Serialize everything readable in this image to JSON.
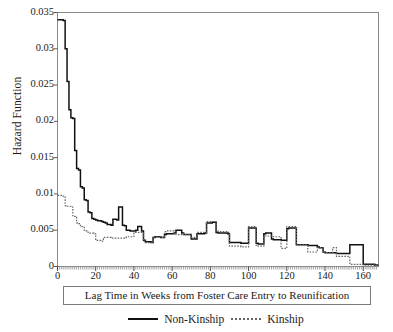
{
  "axes": {
    "ylabel": "Hazard Function",
    "xlabel_box": "Lag Time in Weeks from Foster Care Entry to Reunification",
    "yticks": [
      "0",
      "0.005",
      "0.01",
      "0.015",
      "0.02",
      "0.025",
      "0.03",
      "0.035"
    ],
    "xticks": [
      "0",
      "20",
      "40",
      "60",
      "80",
      "100",
      "120",
      "140",
      "160"
    ]
  },
  "legend": {
    "items": [
      {
        "label": "Non-Kinship",
        "style": "solid",
        "color": "#111111"
      },
      {
        "label": "Kinship",
        "style": "dashed",
        "color": "#666666"
      }
    ]
  },
  "chart_data": {
    "type": "line",
    "title": "",
    "xlabel": "Lag Time in Weeks from Foster Care Entry to Reunification",
    "ylabel": "Hazard Function",
    "xlim": [
      0,
      168
    ],
    "ylim": [
      0,
      0.035
    ],
    "xticks": [
      0,
      20,
      40,
      60,
      80,
      100,
      120,
      140,
      160
    ],
    "yticks": [
      0,
      0.005,
      0.01,
      0.015,
      0.02,
      0.025,
      0.03,
      0.035
    ],
    "grid": false,
    "legend_position": "below-axes",
    "step": "post",
    "series": [
      {
        "name": "Non-Kinship",
        "style": "solid",
        "color": "#111111",
        "x": [
          0,
          1,
          2,
          3,
          4,
          5,
          6,
          7,
          8,
          9,
          10,
          11,
          12,
          13,
          14,
          15,
          16,
          17,
          18,
          19,
          20,
          21,
          22,
          23,
          24,
          25,
          26,
          27,
          28,
          29,
          30,
          31,
          32,
          33,
          34,
          35,
          36,
          37,
          38,
          39,
          40,
          41,
          42,
          43,
          44,
          45,
          46,
          47,
          48,
          49,
          50,
          51,
          52,
          53,
          54,
          55,
          56,
          57,
          58,
          59,
          60,
          61,
          62,
          63,
          64,
          65,
          66,
          67,
          68,
          69,
          70,
          71,
          72,
          73,
          74,
          75,
          76,
          77,
          78,
          79,
          80,
          81,
          82,
          83,
          84,
          85,
          86,
          87,
          88,
          89,
          90,
          91,
          92,
          93,
          94,
          95,
          96,
          97,
          98,
          99,
          100,
          101,
          102,
          103,
          104,
          105,
          106,
          107,
          108,
          109,
          110,
          111,
          112,
          113,
          114,
          115,
          116,
          117,
          118,
          119,
          120,
          121,
          122,
          123,
          124,
          125,
          126,
          127,
          128,
          129,
          130,
          131,
          132,
          133,
          134,
          135,
          136,
          137,
          138,
          139,
          140,
          141,
          142,
          143,
          144,
          145,
          146,
          147,
          148,
          149,
          150,
          151,
          152,
          153,
          154,
          155,
          156,
          157,
          158,
          159,
          160,
          161,
          162,
          163,
          164,
          165,
          166,
          167
        ],
        "y": [
          0.034,
          0.034,
          0.034,
          0.0339,
          0.03,
          0.0255,
          0.0216,
          0.0205,
          0.0204,
          0.016,
          0.0135,
          0.0133,
          0.011,
          0.0108,
          0.0092,
          0.0091,
          0.0075,
          0.0074,
          0.0066,
          0.0065,
          0.0064,
          0.0063,
          0.0063,
          0.0062,
          0.0061,
          0.006,
          0.0058,
          0.0058,
          0.0057,
          0.0065,
          0.0065,
          0.0064,
          0.0082,
          0.0082,
          0.0057,
          0.0056,
          0.005,
          0.005,
          0.0049,
          0.0049,
          0.0049,
          0.005,
          0.0055,
          0.0055,
          0.0049,
          0.0036,
          0.0034,
          0.0034,
          0.0034,
          0.0033,
          0.004,
          0.0041,
          0.0041,
          0.0041,
          0.004,
          0.004,
          0.0044,
          0.0045,
          0.0045,
          0.0045,
          0.0045,
          0.0046,
          0.005,
          0.005,
          0.005,
          0.0046,
          0.0044,
          0.0044,
          0.0044,
          0.0044,
          0.0038,
          0.0038,
          0.0038,
          0.0045,
          0.0045,
          0.0045,
          0.0045,
          0.0046,
          0.006,
          0.006,
          0.006,
          0.0061,
          0.0061,
          0.0047,
          0.0046,
          0.0046,
          0.0046,
          0.0046,
          0.0046,
          0.0045,
          0.0033,
          0.0033,
          0.0033,
          0.0033,
          0.0033,
          0.0033,
          0.0032,
          0.0032,
          0.0032,
          0.0032,
          0.0053,
          0.0053,
          0.0053,
          0.0053,
          0.0032,
          0.0031,
          0.0031,
          0.0031,
          0.0045,
          0.0046,
          0.0046,
          0.0046,
          0.0038,
          0.0037,
          0.0037,
          0.0037,
          0.0037,
          0.0036,
          0.0036,
          0.0036,
          0.0052,
          0.0053,
          0.0053,
          0.0053,
          0.0053,
          0.003,
          0.003,
          0.003,
          0.003,
          0.003,
          0.003,
          0.0029,
          0.0029,
          0.0029,
          0.0029,
          0.0029,
          0.0027,
          0.0026,
          0.0026,
          0.002,
          0.0019,
          0.0019,
          0.0019,
          0.0019,
          0.0019,
          0.0019,
          0.0018,
          0.0018,
          0.0018,
          0.0018,
          0.0018,
          0.0018,
          0.0018,
          0.003,
          0.003,
          0.003,
          0.003,
          0.003,
          0.003,
          0.003,
          0.0003,
          0.0003,
          0.0003,
          0.0003,
          0.0003,
          0.0003,
          0.0002,
          0.0002
        ],
        "start_value": 0.034,
        "peak": {
          "x": 1,
          "y": 0.034
        }
      },
      {
        "name": "Kinship",
        "style": "dashed",
        "color": "#666666",
        "x": [
          0,
          1,
          2,
          3,
          4,
          5,
          6,
          7,
          8,
          9,
          10,
          11,
          12,
          13,
          14,
          15,
          16,
          17,
          18,
          19,
          20,
          21,
          22,
          23,
          24,
          25,
          26,
          27,
          28,
          29,
          30,
          31,
          32,
          33,
          34,
          35,
          36,
          37,
          38,
          39,
          40,
          41,
          42,
          43,
          44,
          45,
          46,
          47,
          48,
          49,
          50,
          51,
          52,
          53,
          54,
          55,
          56,
          57,
          58,
          59,
          60,
          61,
          62,
          63,
          64,
          65,
          66,
          67,
          68,
          69,
          70,
          71,
          72,
          73,
          74,
          75,
          76,
          77,
          78,
          79,
          80,
          81,
          82,
          83,
          84,
          85,
          86,
          87,
          88,
          89,
          90,
          91,
          92,
          93,
          94,
          95,
          96,
          97,
          98,
          99,
          100,
          101,
          102,
          103,
          104,
          105,
          106,
          107,
          108,
          109,
          110,
          111,
          112,
          113,
          114,
          115,
          116,
          117,
          118,
          119,
          120,
          121,
          122,
          123,
          124,
          125,
          126,
          127,
          128,
          129,
          130,
          131,
          132,
          133,
          134,
          135,
          136,
          137,
          138,
          139,
          140,
          141,
          142,
          143,
          144,
          145,
          146,
          147,
          148,
          149,
          150,
          151,
          152,
          153,
          154,
          155,
          156,
          157,
          158,
          159,
          160,
          161,
          162,
          163,
          164,
          165,
          166,
          167
        ],
        "y": [
          0.0098,
          0.0098,
          0.0097,
          0.0097,
          0.0084,
          0.0083,
          0.0083,
          0.0082,
          0.007,
          0.0069,
          0.006,
          0.0059,
          0.0055,
          0.0054,
          0.005,
          0.0049,
          0.0046,
          0.0046,
          0.0046,
          0.0045,
          0.0036,
          0.0036,
          0.0036,
          0.0035,
          0.004,
          0.004,
          0.004,
          0.004,
          0.0039,
          0.0039,
          0.0039,
          0.0039,
          0.0039,
          0.0039,
          0.0039,
          0.0039,
          0.0041,
          0.0041,
          0.0041,
          0.0041,
          0.0047,
          0.0047,
          0.0047,
          0.0047,
          0.0047,
          0.0035,
          0.0033,
          0.0033,
          0.0033,
          0.0033,
          0.0041,
          0.0041,
          0.0041,
          0.0041,
          0.004,
          0.004,
          0.0048,
          0.0049,
          0.0049,
          0.0049,
          0.0049,
          0.0046,
          0.0044,
          0.0044,
          0.0044,
          0.0045,
          0.0044,
          0.0044,
          0.0044,
          0.0044,
          0.004,
          0.004,
          0.004,
          0.0047,
          0.0047,
          0.0047,
          0.0047,
          0.0047,
          0.0062,
          0.0062,
          0.0062,
          0.0062,
          0.0062,
          0.0049,
          0.0048,
          0.0048,
          0.0048,
          0.0048,
          0.0048,
          0.0047,
          0.0028,
          0.0028,
          0.0028,
          0.0028,
          0.0028,
          0.0028,
          0.0027,
          0.0027,
          0.0027,
          0.0027,
          0.0055,
          0.0055,
          0.0055,
          0.0055,
          0.0028,
          0.0028,
          0.0028,
          0.0028,
          0.0042,
          0.0042,
          0.0042,
          0.0042,
          0.0041,
          0.0041,
          0.0041,
          0.0041,
          0.0041,
          0.0025,
          0.0025,
          0.0025,
          0.0055,
          0.0055,
          0.0055,
          0.0055,
          0.0055,
          0.003,
          0.003,
          0.003,
          0.003,
          0.003,
          0.003,
          0.002,
          0.002,
          0.002,
          0.002,
          0.002,
          0.0026,
          0.0026,
          0.0026,
          0.002,
          0.0019,
          0.0019,
          0.0019,
          0.0019,
          0.0026,
          0.0026,
          0.0014,
          0.0014,
          0.0014,
          0.0014,
          0.0014,
          0.0014,
          0.0014,
          0.0003,
          0.0003,
          0.0003,
          0.0003,
          0.0003,
          0.0003,
          0.0003,
          0.0002,
          0.0002,
          0.0002,
          0.0002,
          0.0002,
          0.0002,
          0.0002,
          0.0002
        ],
        "start_value": 0.0098
      }
    ]
  }
}
